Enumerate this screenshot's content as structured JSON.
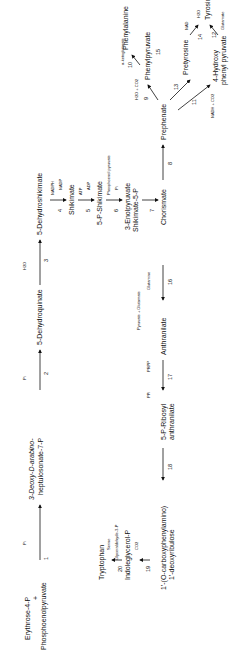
{
  "nodes": {
    "e4p": "Erythrose-4-P",
    "plus": "+",
    "pep": "Phosphoenolpyruvate",
    "dahp1": "3-Deoxy-D-arabino-",
    "dahp2": "heptulosonate-7-P",
    "dhq": "5-Dehydroquinate",
    "dhs": "5-Dehydroshikimate",
    "shik": "Shikimate",
    "s5p": "5-P-Shikimate",
    "eps1": "3-Enolpyruvate",
    "eps2": "Shikimate-5-P",
    "chor": "Chorismate",
    "prep": "Prephenate",
    "php": "Phenylpyruvate",
    "phe": "Phenylalanine",
    "pretyr": "Pretyrosine",
    "hpp1": "4-Hydroxy",
    "hpp2": "phenyl pyruvate",
    "tyr": "Tyrosine",
    "anth": "Anthranilate",
    "pra1": "5-P-Ribosyl",
    "pra2": "anthranilate",
    "cdrp1": "1'-(O-carboxyphenylamino)",
    "cdrp2": "1'-deoxyribulose",
    "igp": "Indoleglycerol-P",
    "trp": "Tryptophan"
  },
  "cofactors": {
    "pi1": "Pi",
    "pi2": "Pi",
    "h2o3": "H2O",
    "nadph": "NADPH",
    "nadp": "NADP",
    "atp": "ATP",
    "adp": "ADP",
    "pep6": "Phosphoenol pyruvate",
    "pi6": "Pi",
    "h2oco2_9": "H2O + CO2",
    "akg10": "α-ketoglutarate",
    "glu10": "Glutamate",
    "glu13": "Glutamate",
    "akg13": "α-ketoglutarate",
    "nad11": "NAD",
    "nadh11": "NADH + CO2",
    "h2o15": "H2O",
    "co2_15": "CO2",
    "nad14": "NAD",
    "nadh14": "NADH + CO2",
    "glu12": "Glutamate",
    "akg12": "α-ketoglutarate",
    "gln16": "Glutamine",
    "pyr16": "Pyruvate + Glutamate",
    "prpp": "PRPP",
    "ppi": "PPi",
    "g3p": "Glyceraldehyde-3-P",
    "ser": "Serine",
    "co2_19": "CO2",
    "h2o19": "H2O"
  },
  "steps": [
    "1",
    "2",
    "3",
    "4",
    "5",
    "6",
    "7",
    "8",
    "9",
    "10",
    "11",
    "12",
    "13",
    "14",
    "15",
    "16",
    "17",
    "18",
    "19",
    "20"
  ]
}
